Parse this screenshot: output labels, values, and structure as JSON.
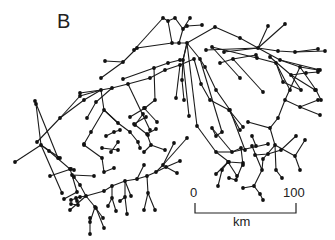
{
  "figure": {
    "panel_label": "B"
  },
  "scale_bar": {
    "start_label": "0",
    "end_label": "100",
    "unit_label": "km"
  },
  "network": {
    "nodes": [
      [
        163,
        18
      ],
      [
        168,
        21
      ],
      [
        175,
        18
      ],
      [
        190,
        18
      ],
      [
        202,
        25
      ],
      [
        200,
        28
      ],
      [
        187,
        26
      ],
      [
        183,
        29
      ],
      [
        172,
        43
      ],
      [
        179,
        43
      ],
      [
        187,
        43
      ],
      [
        134,
        50
      ],
      [
        137,
        48
      ],
      [
        105,
        61
      ],
      [
        123,
        62
      ],
      [
        101,
        78
      ],
      [
        123,
        79
      ],
      [
        215,
        27
      ],
      [
        241,
        38
      ],
      [
        268,
        26
      ],
      [
        285,
        24
      ],
      [
        242,
        43
      ],
      [
        257,
        48
      ],
      [
        275,
        40
      ],
      [
        277,
        44
      ],
      [
        294,
        52
      ],
      [
        318,
        49
      ],
      [
        300,
        50
      ],
      [
        325,
        51
      ],
      [
        208,
        50
      ],
      [
        194,
        59
      ],
      [
        200,
        59
      ],
      [
        192,
        66
      ],
      [
        202,
        72
      ],
      [
        180,
        79
      ],
      [
        176,
        98
      ],
      [
        183,
        103
      ],
      [
        189,
        116
      ],
      [
        197,
        126
      ],
      [
        184,
        100
      ],
      [
        196,
        118
      ],
      [
        199,
        84
      ],
      [
        205,
        87
      ],
      [
        220,
        70
      ],
      [
        250,
        78
      ],
      [
        240,
        80
      ],
      [
        268,
        79
      ],
      [
        263,
        91
      ],
      [
        275,
        115
      ],
      [
        240,
        92
      ],
      [
        253,
        109
      ],
      [
        187,
        122
      ],
      [
        260,
        112
      ],
      [
        283,
        82
      ],
      [
        306,
        73
      ],
      [
        280,
        68
      ],
      [
        315,
        70
      ],
      [
        301,
        90
      ],
      [
        321,
        88
      ],
      [
        142,
        67
      ],
      [
        154,
        68
      ],
      [
        155,
        72
      ],
      [
        155,
        100
      ],
      [
        110,
        85
      ],
      [
        130,
        115
      ],
      [
        150,
        130
      ],
      [
        80,
        93
      ],
      [
        101,
        90
      ],
      [
        112,
        95
      ],
      [
        104,
        130
      ],
      [
        60,
        118
      ],
      [
        80,
        96
      ],
      [
        40,
        142
      ],
      [
        46,
        154
      ],
      [
        39,
        162
      ],
      [
        21,
        172
      ],
      [
        104,
        110
      ],
      [
        87,
        118
      ],
      [
        91,
        132
      ],
      [
        96,
        148
      ],
      [
        102,
        151
      ],
      [
        98,
        157
      ],
      [
        77,
        144
      ],
      [
        84,
        145
      ],
      [
        70,
        175
      ],
      [
        80,
        160
      ],
      [
        50,
        176
      ],
      [
        49,
        193
      ],
      [
        60,
        188
      ],
      [
        71,
        169
      ],
      [
        70,
        174
      ],
      [
        74,
        177
      ],
      [
        76,
        192
      ],
      [
        71,
        200
      ],
      [
        65,
        201
      ],
      [
        84,
        198
      ],
      [
        77,
        209
      ],
      [
        71,
        210
      ],
      [
        89,
        222
      ],
      [
        90,
        218
      ],
      [
        103,
        218
      ],
      [
        65,
        230
      ],
      [
        137,
        136
      ],
      [
        151,
        133
      ],
      [
        143,
        148
      ],
      [
        150,
        130
      ],
      [
        159,
        160
      ],
      [
        140,
        154
      ],
      [
        144,
        176
      ],
      [
        128,
        185
      ],
      [
        148,
        175
      ],
      [
        144,
        168
      ],
      [
        139,
        169
      ],
      [
        141,
        181
      ],
      [
        171,
        143
      ],
      [
        171,
        135
      ],
      [
        162,
        149
      ],
      [
        166,
        135
      ],
      [
        184,
        176
      ],
      [
        188,
        163
      ],
      [
        170,
        138
      ],
      [
        162,
        182
      ],
      [
        174,
        180
      ],
      [
        174,
        149
      ],
      [
        179,
        147
      ],
      [
        180,
        133
      ],
      [
        125,
        213
      ],
      [
        116,
        211
      ],
      [
        129,
        200
      ],
      [
        132,
        188
      ],
      [
        118,
        185
      ],
      [
        109,
        194
      ],
      [
        112,
        198
      ],
      [
        112,
        210
      ],
      [
        106,
        197
      ],
      [
        112,
        204
      ],
      [
        98,
        202
      ],
      [
        102,
        207
      ],
      [
        124,
        194
      ],
      [
        134,
        202
      ],
      [
        145,
        214
      ],
      [
        153,
        211
      ],
      [
        147,
        206
      ],
      [
        154,
        199
      ],
      [
        165,
        200
      ],
      [
        167,
        202
      ],
      [
        181,
        197
      ],
      [
        177,
        211
      ],
      [
        194,
        208
      ],
      [
        196,
        192
      ],
      [
        203,
        193
      ],
      [
        210,
        166
      ],
      [
        221,
        166
      ],
      [
        228,
        162
      ],
      [
        216,
        152
      ],
      [
        222,
        132
      ],
      [
        232,
        152
      ],
      [
        243,
        163
      ],
      [
        241,
        148
      ],
      [
        229,
        162
      ],
      [
        216,
        174
      ],
      [
        218,
        186
      ],
      [
        229,
        178
      ],
      [
        237,
        194
      ],
      [
        254,
        186
      ],
      [
        263,
        159
      ],
      [
        264,
        150
      ],
      [
        243,
        127
      ],
      [
        248,
        122
      ],
      [
        252,
        136
      ],
      [
        260,
        134
      ],
      [
        268,
        144
      ],
      [
        276,
        150
      ],
      [
        291,
        152
      ],
      [
        296,
        136
      ],
      [
        300,
        130
      ],
      [
        298,
        110
      ],
      [
        305,
        125
      ],
      [
        305,
        140
      ],
      [
        310,
        136
      ],
      [
        293,
        152
      ],
      [
        285,
        159
      ],
      [
        276,
        170
      ],
      [
        276,
        176
      ],
      [
        271,
        184
      ],
      [
        266,
        189
      ],
      [
        279,
        194
      ],
      [
        277,
        199
      ],
      [
        268,
        202
      ],
      [
        258,
        198
      ],
      [
        260,
        187
      ],
      [
        251,
        190
      ],
      [
        245,
        190
      ]
    ]
  }
}
